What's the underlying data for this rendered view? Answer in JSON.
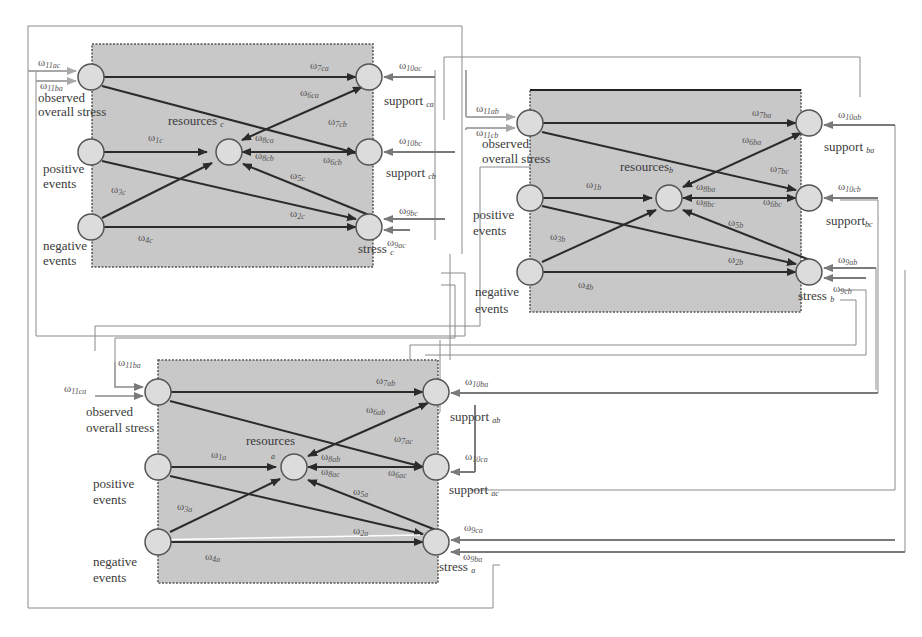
{
  "figure": {
    "colors": {
      "panel_fill": "#c8c8c8",
      "node_fill": "#dcdcdc",
      "node_stroke": "#555555",
      "internal_edge": "#2b2b2b",
      "external_wire": "#7a7a7a",
      "outer_frame": "#9a9a9a"
    }
  },
  "panels": {
    "c": {
      "observed": "observed",
      "overall_stress": "overall stress",
      "positive": "positive",
      "positive_events": "events",
      "negative": "negative",
      "negative_events": "events",
      "resources": "resources",
      "resources_sub": "c",
      "support1": "support",
      "support1_sub": "ca",
      "support2": "support",
      "support2_sub": "cb",
      "stress": "stress",
      "stress_sub": "c",
      "weights": {
        "w11ac": [
          "ω",
          "11ac"
        ],
        "w11ba": [
          "ω",
          "11ba"
        ],
        "w7ca": [
          "ω",
          "7ca"
        ],
        "w6ca": [
          "ω",
          "6ca"
        ],
        "w7cb": [
          "ω",
          "7cb"
        ],
        "w1c": [
          "ω",
          "1c"
        ],
        "w8ca": [
          "ω",
          "8ca"
        ],
        "w8cb": [
          "ω",
          "8cb"
        ],
        "w6cb": [
          "ω",
          "6cb"
        ],
        "w3c": [
          "ω",
          "3c"
        ],
        "w5c": [
          "ω",
          "5c"
        ],
        "w2c": [
          "ω",
          "2c"
        ],
        "w4c": [
          "ω",
          "4c"
        ],
        "w10ac": [
          "ω",
          "10ac"
        ],
        "w10bc": [
          "ω",
          "10bc"
        ],
        "w9bc": [
          "ω",
          "9bc"
        ],
        "w9ac": [
          "ω",
          "9ac"
        ]
      }
    },
    "b": {
      "observed": "observed",
      "overall_stress": "overall stress",
      "positive": "positive",
      "positive_events": "events",
      "negative": "negative",
      "negative_events": "events",
      "resources": "resources",
      "resources_sub": "b",
      "support1": "support",
      "support1_sub": "ba",
      "support2": "support",
      "support2_sub": "bc",
      "stress": "stress",
      "stress_sub": "b",
      "weights": {
        "w11ab": [
          "ω",
          "11ab"
        ],
        "w11cb": [
          "ω",
          "11cb"
        ],
        "w7ba": [
          "ω",
          "7ba"
        ],
        "w6ba": [
          "ω",
          "6ba"
        ],
        "w7bc": [
          "ω",
          "7bc"
        ],
        "w1b": [
          "ω",
          "1b"
        ],
        "w8ba": [
          "ω",
          "8ba"
        ],
        "w8bc": [
          "ω",
          "8bc"
        ],
        "w6bc": [
          "ω",
          "6bc"
        ],
        "w3b": [
          "ω",
          "3b"
        ],
        "w5b": [
          "ω",
          "5b"
        ],
        "w2b": [
          "ω",
          "2b"
        ],
        "w4b": [
          "ω",
          "4b"
        ],
        "w10ab": [
          "ω",
          "10ab"
        ],
        "w10cb": [
          "ω",
          "10cb"
        ],
        "w9ab": [
          "ω",
          "9ab"
        ],
        "w9cb": [
          "ω",
          "9cb"
        ]
      }
    },
    "a": {
      "observed": "observed",
      "overall_stress": "overall stress",
      "positive": "positive",
      "positive_events": "events",
      "negative": "negative",
      "negative_events": "events",
      "resources": "resources",
      "resources_sub": "a",
      "support1": "support",
      "support1_sub": "ab",
      "support2": "support",
      "support2_sub": "ac",
      "stress": "stress",
      "stress_sub": "a",
      "weights": {
        "w11ba": [
          "ω",
          "11ba"
        ],
        "w11ca": [
          "ω",
          "11ca"
        ],
        "w7ab": [
          "ω",
          "7ab"
        ],
        "w6ab": [
          "ω",
          "6ab"
        ],
        "w7ac": [
          "ω",
          "7ac"
        ],
        "w1a": [
          "ω",
          "1a"
        ],
        "w8ab": [
          "ω",
          "8ab"
        ],
        "w8ac": [
          "ω",
          "8ac"
        ],
        "w6ac": [
          "ω",
          "6ac"
        ],
        "w3a": [
          "ω",
          "3a"
        ],
        "w5a": [
          "ω",
          "5a"
        ],
        "w2a": [
          "ω",
          "2a"
        ],
        "w4a": [
          "ω",
          "4a"
        ],
        "w10ba": [
          "ω",
          "10ba"
        ],
        "w10ca": [
          "ω",
          "10ca"
        ],
        "w9ca": [
          "ω",
          "9ca"
        ],
        "w9ba": [
          "ω",
          "9ba"
        ]
      }
    }
  }
}
